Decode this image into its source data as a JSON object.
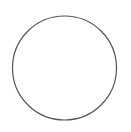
{
  "canvas": {
    "width": 131,
    "height": 132,
    "background": "#ffffff"
  },
  "shapes": [
    {
      "type": "circle",
      "cx": 64.5,
      "cy": 68,
      "r": 52,
      "stroke": "#555555",
      "stroke_width": 1.2,
      "fill": "none"
    }
  ]
}
